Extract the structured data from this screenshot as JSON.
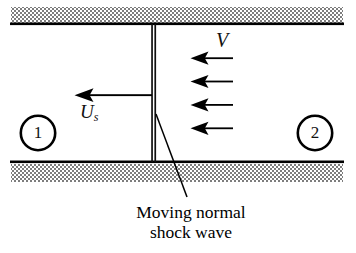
{
  "figure": {
    "type": "technical-diagram",
    "background_color": "#ffffff",
    "ink_color": "#000000"
  },
  "walls": {
    "top": {
      "name": "top-duct-wall",
      "hatch_style": "checkerboard-stipple",
      "hatch_color": "#8a8a8a",
      "line_color": "#000000"
    },
    "bottom": {
      "name": "bottom-duct-wall",
      "hatch_style": "checkerboard-stipple",
      "hatch_color": "#8a8a8a",
      "line_color": "#000000"
    }
  },
  "shock": {
    "name": "moving-normal-shock-wave",
    "style": "double-vertical-line"
  },
  "labels": {
    "shock_speed": "U",
    "shock_speed_subscript": "s",
    "flow_velocity": "V",
    "zone_upstream": "1",
    "zone_downstream": "2"
  },
  "caption": {
    "line1": "Moving normal",
    "line2": "shock wave"
  },
  "flow_arrows": {
    "name": "incoming-flow-arrows",
    "count": 4,
    "direction": "left",
    "label": "V"
  },
  "shock_arrow": {
    "name": "shock-velocity-arrow",
    "direction": "left",
    "label": "Us"
  }
}
